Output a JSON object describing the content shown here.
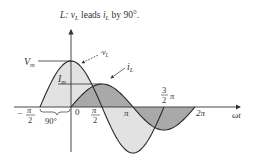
{
  "title": {
    "prefix": "L: ",
    "v": "v",
    "v_sub": "L",
    "mid": " leads ",
    "i": "i",
    "i_sub": "L",
    "suffix": " by 90°."
  },
  "labels": {
    "Vm": "V",
    "Vm_sub": "m",
    "Im": "I",
    "Im_sub": "m",
    "vL": "v",
    "vL_sub": "L",
    "iL": "i",
    "iL_sub": "L",
    "wt": "ωt",
    "zero": "0",
    "neg_pi_2_sign": "−",
    "pi": "π",
    "two": "2",
    "three": "3",
    "two_pi": "2π",
    "phase": "90°"
  },
  "colors": {
    "curve": "#2a2a2a",
    "vL_fill": "#e2e2e2",
    "iL_fill": "#a8a8a8",
    "axis": "#333333"
  },
  "chart_data": {
    "type": "line",
    "title": "L: vL leads iL by 90°.",
    "xlabel": "ωt",
    "ylabel": "",
    "x_ticks": [
      "−π/2",
      "0",
      "π/2",
      "π",
      "3/2 π",
      "2π"
    ],
    "series": [
      {
        "name": "vL",
        "function": "Vm·cos(ωt)",
        "amplitude_label": "Vm",
        "x_range": [
          "−π/2",
          "3π/2"
        ],
        "fill": "light gray"
      },
      {
        "name": "iL",
        "function": "Im·sin(ωt)",
        "amplitude_label": "Im",
        "x_range": [
          "0",
          "2π"
        ],
        "fill": "dark gray"
      }
    ],
    "annotations": [
      "90° phase difference bracket between −π/2 and 0"
    ],
    "relative_amplitude": {
      "Vm": 1.0,
      "Im": 0.5
    }
  }
}
